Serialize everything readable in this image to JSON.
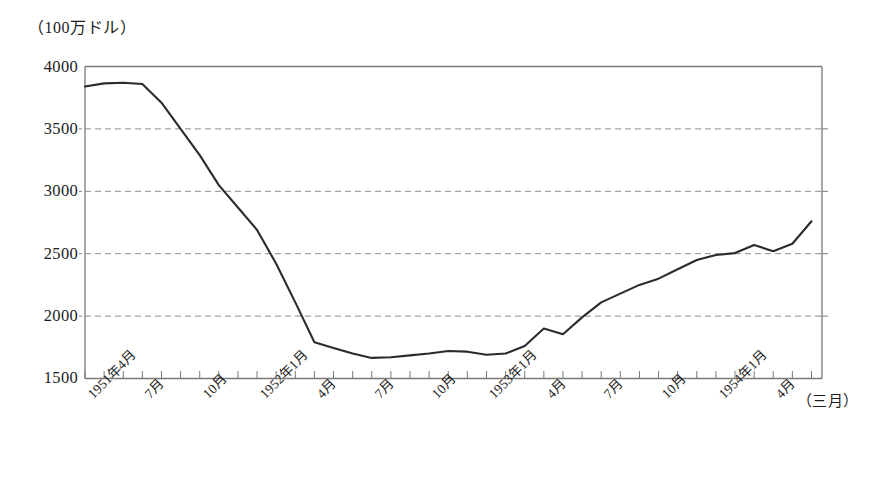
{
  "chart_data": {
    "type": "line",
    "title": "",
    "subtitle": "",
    "ylabel": "（100万ドル）",
    "xlabel": "（三月）",
    "ylim": [
      1500,
      4000
    ],
    "yticks": [
      1500,
      2000,
      2500,
      3000,
      3500,
      4000
    ],
    "ytick_labels": [
      "1500",
      "2000",
      "2500",
      "3000",
      "3500",
      "4000"
    ],
    "grid": "horizontal-dashed",
    "legend": "none",
    "xtick_labels": [
      "1951年4月",
      "7月",
      "10月",
      "1952年1月",
      "4月",
      "7月",
      "10月",
      "1953年1月",
      "4月",
      "7月",
      "10月",
      "1954年1月",
      "4月"
    ],
    "xtick_indices": [
      0,
      3,
      6,
      9,
      12,
      15,
      18,
      21,
      24,
      27,
      30,
      33,
      36
    ],
    "x": [
      "1951-04",
      "1951-05",
      "1951-06",
      "1951-07",
      "1951-08",
      "1951-09",
      "1951-10",
      "1951-11",
      "1951-12",
      "1952-01",
      "1952-02",
      "1952-03",
      "1952-04",
      "1952-05",
      "1952-06",
      "1952-07",
      "1952-08",
      "1952-09",
      "1952-10",
      "1952-11",
      "1952-12",
      "1953-01",
      "1953-02",
      "1953-03",
      "1953-04",
      "1953-05",
      "1953-06",
      "1953-07",
      "1953-08",
      "1953-09",
      "1953-10",
      "1953-11",
      "1953-12",
      "1954-01",
      "1954-02",
      "1954-03",
      "1954-04",
      "1954-05",
      "1954-06"
    ],
    "values": [
      3840,
      3865,
      3870,
      3860,
      3710,
      3500,
      3290,
      3050,
      2870,
      2690,
      2420,
      2110,
      1790,
      1745,
      1700,
      1665,
      1670,
      1685,
      1700,
      1720,
      1715,
      1690,
      1700,
      1760,
      1900,
      1855,
      1990,
      2110,
      2180,
      2250,
      2300,
      2375,
      2450,
      2490,
      2505,
      2570,
      2520,
      2580,
      2760
    ],
    "series_name": "",
    "line_color": "#2b2b2b",
    "grid_color": "#8c8c8c",
    "axis_color": "#7a7a7a"
  }
}
